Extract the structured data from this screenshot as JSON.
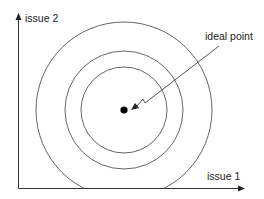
{
  "diagram": {
    "type": "spatial-preference",
    "axes": {
      "x_label": "issue 1",
      "y_label": "issue 2"
    },
    "annotation": {
      "label": "ideal point"
    },
    "center_point": {
      "cx": 124,
      "cy": 110,
      "r": 3.5
    },
    "indifference_curves": [
      {
        "name": "inner",
        "r": 43
      },
      {
        "name": "middle",
        "r": 59
      },
      {
        "name": "outer",
        "r": 88
      }
    ],
    "colors": {
      "line": "#555555",
      "axis": "#333333",
      "point": "#000000",
      "text": "#222222"
    }
  }
}
